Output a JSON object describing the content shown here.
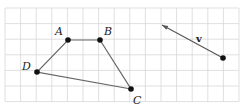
{
  "grid": {
    "x0": 5,
    "y0": 8,
    "step": 15.6,
    "cols": 15,
    "rows": 6,
    "color": "#d8d8d8"
  },
  "quadrilateral": {
    "points": [
      {
        "label": "A",
        "x": 68,
        "y": 40
      },
      {
        "label": "B",
        "x": 100,
        "y": 40
      },
      {
        "label": "C",
        "x": 131,
        "y": 89
      },
      {
        "label": "D",
        "x": 37,
        "y": 72
      }
    ],
    "line_color": "#666666"
  },
  "vector": {
    "label": "v",
    "tail": {
      "x": 223,
      "y": 58
    },
    "head": {
      "x": 162,
      "y": 25
    }
  },
  "labels": {
    "A": "A",
    "B": "B",
    "C": "C",
    "D": "D",
    "v": "v"
  }
}
